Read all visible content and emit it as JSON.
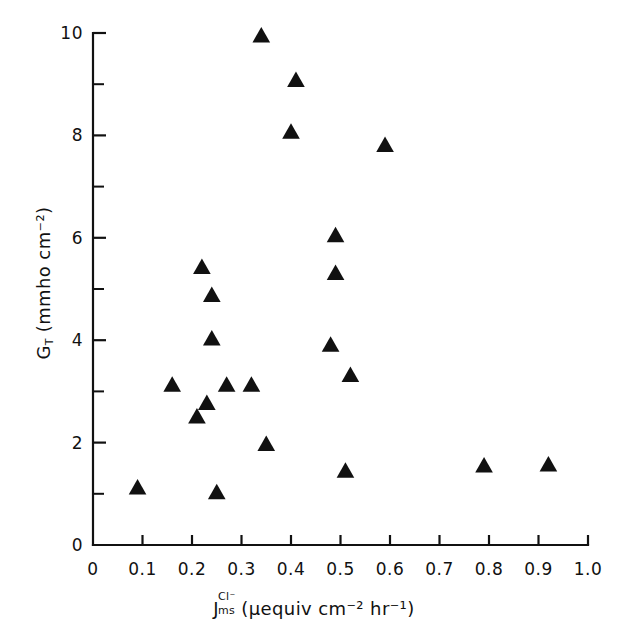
{
  "figure": {
    "background_color": "#ffffff",
    "ink_color": "#111111"
  },
  "axes": {
    "x": {
      "label_parts": {
        "symbol": "J",
        "superscript": "Cl⁻",
        "subscript": "ms",
        "units": "(μequiv cm⁻² hr⁻¹)"
      },
      "label_plain": "J_ms^Cl- (μequiv cm^-2 hr^-1)",
      "tick_labels": [
        "0",
        "0.1",
        "0.2",
        "0.3",
        "0.4",
        "0.5",
        "0.6",
        "0.7",
        "0.8",
        "0.9",
        "1.0"
      ],
      "tick_values": [
        0,
        0.1,
        0.2,
        0.3,
        0.4,
        0.5,
        0.6,
        0.7,
        0.8,
        0.9,
        1.0
      ],
      "range": [
        0,
        1.0
      ]
    },
    "y": {
      "label_parts": {
        "symbol": "G",
        "subscript": "T",
        "units": "(mmho cm⁻²)"
      },
      "label_plain": "G_T (mmho cm^-2)",
      "tick_labels": [
        "0",
        "2",
        "4",
        "6",
        "8",
        "10"
      ],
      "tick_values": [
        0,
        2,
        4,
        6,
        8,
        10
      ],
      "minor_tick_values": [
        1,
        3,
        5,
        7,
        9
      ],
      "range": [
        0,
        10
      ]
    }
  },
  "chart_data": {
    "type": "scatter",
    "title": "",
    "xlabel": "J_ms^Cl- (μequiv cm^-2 hr^-1)",
    "ylabel": "G_T (mmho cm^-2)",
    "xlim": [
      0,
      1.0
    ],
    "ylim": [
      0,
      10
    ],
    "grid": false,
    "legend": null,
    "marker": {
      "shape": "triangle-up",
      "color": "#111111",
      "size_px": 15
    },
    "series": [
      {
        "name": "G_T vs J_ms^Cl-",
        "points": [
          {
            "x": 0.09,
            "y": 1.12
          },
          {
            "x": 0.16,
            "y": 3.13
          },
          {
            "x": 0.21,
            "y": 2.51
          },
          {
            "x": 0.22,
            "y": 5.43
          },
          {
            "x": 0.23,
            "y": 2.77
          },
          {
            "x": 0.24,
            "y": 4.88
          },
          {
            "x": 0.24,
            "y": 4.03
          },
          {
            "x": 0.25,
            "y": 1.03
          },
          {
            "x": 0.27,
            "y": 3.13
          },
          {
            "x": 0.32,
            "y": 3.13
          },
          {
            "x": 0.34,
            "y": 9.95
          },
          {
            "x": 0.35,
            "y": 1.97
          },
          {
            "x": 0.4,
            "y": 8.07
          },
          {
            "x": 0.41,
            "y": 9.08
          },
          {
            "x": 0.48,
            "y": 3.91
          },
          {
            "x": 0.49,
            "y": 6.05
          },
          {
            "x": 0.49,
            "y": 5.31
          },
          {
            "x": 0.51,
            "y": 1.45
          },
          {
            "x": 0.52,
            "y": 3.32
          },
          {
            "x": 0.59,
            "y": 7.81
          },
          {
            "x": 0.79,
            "y": 1.55
          },
          {
            "x": 0.92,
            "y": 1.57
          }
        ]
      }
    ]
  }
}
